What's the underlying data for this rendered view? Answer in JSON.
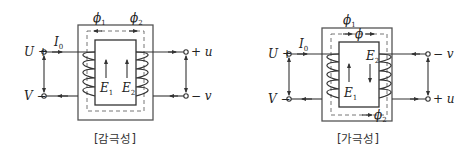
{
  "diagrams": [
    {
      "caption": "[감극성]",
      "flux_labels": [
        "ϕ",
        "ϕ"
      ],
      "flux_subs": [
        "1",
        "2"
      ],
      "current_label": "I",
      "current_sub": "0",
      "primary_terminals": {
        "top": "U +",
        "bottom": "V −"
      },
      "secondary_terminals": {
        "top": "+ u",
        "bottom": "− v"
      },
      "emf_labels": [
        {
          "text": "E",
          "sub": "1"
        },
        {
          "text": "E",
          "sub": "2"
        }
      ]
    },
    {
      "caption": "[가극성]",
      "flux_labels": [
        "ϕ",
        "ϕ",
        "ϕ"
      ],
      "flux_subs": [
        "1",
        "",
        "2"
      ],
      "current_label": "I",
      "current_sub": "0",
      "primary_terminals": {
        "top": "U +",
        "bottom": "V −"
      },
      "secondary_terminals": {
        "top": "− v",
        "bottom": "+ u"
      },
      "emf_labels": [
        {
          "text": "E",
          "sub": "1"
        },
        {
          "text": "E",
          "sub": "2"
        }
      ]
    }
  ]
}
